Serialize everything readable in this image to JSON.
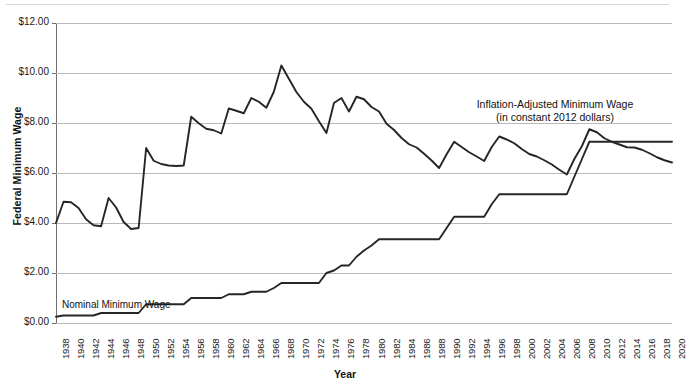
{
  "chart_data": {
    "type": "line",
    "title": "",
    "xlabel": "Year",
    "ylabel": "Federal Minimum Wage",
    "xlim": [
      1938,
      2020
    ],
    "ylim": [
      0,
      12
    ],
    "grid": true,
    "legend_position": "inline-annotation",
    "ytick_labels": [
      "$12.00",
      "$10.00",
      "$8.00",
      "$6.00",
      "$4.00",
      "$2.00",
      "$0.00"
    ],
    "ytick_values": [
      12,
      10,
      8,
      6,
      4,
      2,
      0
    ],
    "xtick_labels": [
      "1938",
      "1940",
      "1942",
      "1944",
      "1946",
      "1948",
      "1950",
      "1952",
      "1954",
      "1956",
      "1958",
      "1960",
      "1962",
      "1964",
      "1966",
      "1968",
      "1970",
      "1972",
      "1974",
      "1976",
      "1978",
      "1980",
      "1982",
      "1984",
      "1986",
      "1988",
      "1990",
      "1992",
      "1994",
      "1996",
      "1998",
      "2000",
      "2002",
      "2004",
      "2006",
      "2008",
      "2010",
      "2012",
      "2014",
      "2016",
      "2018",
      "2020"
    ],
    "annotations": [
      {
        "name": "inflation-adjusted-label",
        "line1": "Inflation-Adjusted Minimum Wage",
        "line2": "(in constant 2012 dollars)"
      },
      {
        "name": "nominal-label",
        "text": "Nominal Minimum Wage"
      }
    ],
    "series": [
      {
        "name": "Nominal Minimum Wage",
        "color": "#262626",
        "x": [
          1938,
          1939,
          1940,
          1941,
          1942,
          1943,
          1944,
          1945,
          1946,
          1947,
          1948,
          1949,
          1950,
          1951,
          1952,
          1953,
          1954,
          1955,
          1956,
          1957,
          1958,
          1959,
          1960,
          1961,
          1962,
          1963,
          1964,
          1965,
          1966,
          1967,
          1968,
          1969,
          1970,
          1971,
          1972,
          1973,
          1974,
          1975,
          1976,
          1977,
          1978,
          1979,
          1980,
          1981,
          1982,
          1983,
          1984,
          1985,
          1986,
          1987,
          1988,
          1989,
          1990,
          1991,
          1992,
          1993,
          1994,
          1995,
          1996,
          1997,
          1998,
          1999,
          2000,
          2001,
          2002,
          2003,
          2004,
          2005,
          2006,
          2007,
          2008,
          2009,
          2010,
          2011,
          2012,
          2013,
          2014,
          2015,
          2016,
          2017,
          2018,
          2019,
          2020
        ],
        "values": [
          0.25,
          0.3,
          0.3,
          0.3,
          0.3,
          0.3,
          0.4,
          0.4,
          0.4,
          0.4,
          0.4,
          0.4,
          0.75,
          0.75,
          0.75,
          0.75,
          0.75,
          0.75,
          1.0,
          1.0,
          1.0,
          1.0,
          1.0,
          1.15,
          1.15,
          1.15,
          1.25,
          1.25,
          1.25,
          1.4,
          1.6,
          1.6,
          1.6,
          1.6,
          1.6,
          1.6,
          2.0,
          2.1,
          2.3,
          2.3,
          2.65,
          2.9,
          3.1,
          3.35,
          3.35,
          3.35,
          3.35,
          3.35,
          3.35,
          3.35,
          3.35,
          3.35,
          3.8,
          4.25,
          4.25,
          4.25,
          4.25,
          4.25,
          4.75,
          5.15,
          5.15,
          5.15,
          5.15,
          5.15,
          5.15,
          5.15,
          5.15,
          5.15,
          5.15,
          5.85,
          6.55,
          7.25,
          7.25,
          7.25,
          7.25,
          7.25,
          7.25,
          7.25,
          7.25,
          7.25,
          7.25,
          7.25,
          7.25
        ]
      },
      {
        "name": "Inflation-Adjusted Minimum Wage (in constant 2012 dollars)",
        "color": "#262626",
        "x": [
          1938,
          1939,
          1940,
          1941,
          1942,
          1943,
          1944,
          1945,
          1946,
          1947,
          1948,
          1949,
          1950,
          1951,
          1952,
          1953,
          1954,
          1955,
          1956,
          1957,
          1958,
          1959,
          1960,
          1961,
          1962,
          1963,
          1964,
          1965,
          1966,
          1967,
          1968,
          1969,
          1970,
          1971,
          1972,
          1973,
          1974,
          1975,
          1976,
          1977,
          1978,
          1979,
          1980,
          1981,
          1982,
          1983,
          1984,
          1985,
          1986,
          1987,
          1988,
          1989,
          1990,
          1991,
          1992,
          1993,
          1994,
          1995,
          1996,
          1997,
          1998,
          1999,
          2000,
          2001,
          2002,
          2003,
          2004,
          2005,
          2006,
          2007,
          2008,
          2009,
          2010,
          2011,
          2012,
          2013,
          2014,
          2015,
          2016,
          2017,
          2018,
          2019,
          2020
        ],
        "values": [
          4.0,
          4.85,
          4.83,
          4.6,
          4.15,
          3.91,
          3.87,
          5.0,
          4.62,
          4.04,
          3.76,
          3.8,
          7.0,
          6.49,
          6.36,
          6.3,
          6.28,
          6.3,
          8.25,
          7.99,
          7.77,
          7.71,
          7.58,
          8.58,
          8.49,
          8.39,
          9.0,
          8.85,
          8.61,
          9.25,
          10.3,
          9.77,
          9.24,
          8.85,
          8.57,
          8.07,
          7.6,
          8.8,
          9.0,
          8.46,
          9.05,
          8.95,
          8.64,
          8.46,
          7.97,
          7.72,
          7.4,
          7.15,
          7.02,
          6.77,
          6.5,
          6.2,
          6.75,
          7.25,
          7.04,
          6.83,
          6.66,
          6.48,
          7.04,
          7.46,
          7.34,
          7.19,
          6.96,
          6.76,
          6.66,
          6.51,
          6.34,
          6.13,
          5.94,
          6.56,
          7.07,
          7.75,
          7.63,
          7.39,
          7.25,
          7.14,
          7.03,
          7.02,
          6.93,
          6.79,
          6.63,
          6.51,
          6.42
        ]
      }
    ]
  }
}
